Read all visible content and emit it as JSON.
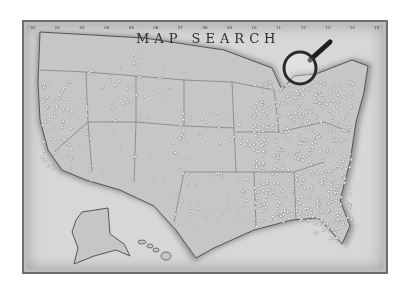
{
  "map": {
    "title": "MAP SEARCH",
    "ruler_labels": [
      "01",
      "02",
      "03",
      "04",
      "05",
      "06",
      "07",
      "08",
      "09",
      "10",
      "11",
      "12",
      "13",
      "14",
      "15"
    ],
    "colors": {
      "land": "#c4c4c4",
      "sea": "#dcdcdc",
      "border": "#5a5a5a",
      "pin": "#f4f4f4"
    },
    "regions": [
      "contiguous-us",
      "alaska",
      "hawaii"
    ],
    "objects": [
      "push-pins",
      "magnifying-glass"
    ]
  }
}
